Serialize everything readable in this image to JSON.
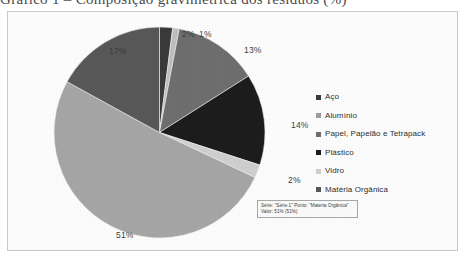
{
  "page": {
    "top_text_fragment": "Gráfico 1 – Composição gravimétrica dos resíduos (%)"
  },
  "chart_data": {
    "type": "pie",
    "title": "",
    "subtitle": "",
    "xlabel": "",
    "ylabel": "",
    "grid": false,
    "legend_position": "right",
    "series_name": "Série 1",
    "categories": [
      "Aço",
      "Alumínio",
      "Papel, Papelão e Tetrapack",
      "Plástico",
      "Vidro",
      "Matéria Orgânica"
    ],
    "values": [
      2,
      1,
      13,
      14,
      2,
      51
    ],
    "value_labels": [
      "2%",
      "1%",
      "13%",
      "14%",
      "2%",
      "51%"
    ],
    "colors": [
      "#3a3a3a",
      "#bfbfbf",
      "#6e6e6e",
      "#1c1c1c",
      "#cfcfcf",
      "#a6a6a6"
    ],
    "extra_slice": {
      "label": "17%",
      "value": 17,
      "color": "#585858",
      "note": "unlabeled dark-gray wedge between Matéria Orgânica and Aço"
    },
    "start_angle_deg": 0,
    "direction": "clockwise"
  },
  "legend": {
    "items": [
      {
        "label": "Aço",
        "color": "#3a3a3a"
      },
      {
        "label": "Alumínio",
        "color": "#9e9e9e"
      },
      {
        "label": "Papel, Papelão e Tetrapack",
        "color": "#6e6e6e"
      },
      {
        "label": "Plástico",
        "color": "#1c1c1c"
      },
      {
        "label": "Vidro",
        "color": "#cfcfcf"
      },
      {
        "label": "Matéria Orgânica",
        "color": "#585858"
      }
    ]
  },
  "pie_labels": [
    {
      "text": "2%",
      "left": 174,
      "top": 17
    },
    {
      "text": "1%",
      "left": 191,
      "top": 17
    },
    {
      "text": "13%",
      "left": 236,
      "top": 33
    },
    {
      "text": "14%",
      "left": 283,
      "top": 108
    },
    {
      "text": "2%",
      "left": 280,
      "top": 163
    },
    {
      "text": "17%",
      "left": 101,
      "top": 34
    },
    {
      "text": "51%",
      "left": 108,
      "top": 218
    }
  ],
  "tooltip": {
    "line1": "Série: \"Série 1\" Ponto: \"Matéria Orgânica\"",
    "line2": "Valor: 51% (51%)"
  },
  "colors": {
    "panel_bg": "#fdfdfd",
    "panel_border": "#c9c9c9",
    "label_text": "#3d3d3d",
    "legend_text": "#2e2e2e"
  }
}
